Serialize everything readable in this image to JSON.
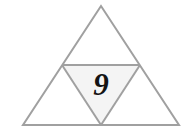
{
  "figure": {
    "name": "subdivided-equilateral-triangle",
    "background_color": "#ffffff",
    "stroke_color": "#a0a0a0",
    "stroke_width": 2,
    "inner_fill_color": "#f4f4f4",
    "label_color": "#141414",
    "width": 195,
    "height": 137
  },
  "outer_triangle": {
    "name": "outer-triangle",
    "apex": {
      "x": 101,
      "y": 6
    },
    "bottom_left": {
      "x": 23,
      "y": 125
    },
    "bottom_right": {
      "x": 179,
      "y": 125
    },
    "fill": "none",
    "label": ""
  },
  "midsegment": {
    "name": "horizontal-midsegment",
    "left": {
      "x": 62,
      "y": 65
    },
    "right": {
      "x": 140,
      "y": 65
    }
  },
  "inner_triangle": {
    "name": "inner-inverted-triangle",
    "top_left": {
      "x": 62,
      "y": 65
    },
    "top_right": {
      "x": 140,
      "y": 65
    },
    "bottom": {
      "x": 101,
      "y": 125
    },
    "fill": "#f4f4f4",
    "label": "9",
    "label_position": {
      "x": 101,
      "y": 95
    },
    "label_font_size": 31
  },
  "regions": [
    {
      "name": "top-triangle",
      "label": ""
    },
    {
      "name": "left-triangle",
      "label": ""
    },
    {
      "name": "right-triangle",
      "label": ""
    },
    {
      "name": "center-triangle",
      "label": "9"
    }
  ],
  "chart_data": {
    "type": "diagram",
    "title": "",
    "shapes": [
      {
        "id": "outer-triangle",
        "kind": "triangle",
        "points": [
          [
            101,
            6
          ],
          [
            23,
            125
          ],
          [
            179,
            125
          ]
        ],
        "fill": "none",
        "stroke": "#a0a0a0",
        "label": ""
      },
      {
        "id": "center-triangle",
        "kind": "triangle",
        "points": [
          [
            62,
            65
          ],
          [
            140,
            65
          ],
          [
            101,
            125
          ]
        ],
        "fill": "#f4f4f4",
        "stroke": "#a0a0a0",
        "label": "9"
      }
    ],
    "lines": [
      {
        "id": "midsegment",
        "from": [
          62,
          65
        ],
        "to": [
          140,
          65
        ],
        "stroke": "#a0a0a0"
      },
      {
        "id": "left-inner-edge",
        "from": [
          62,
          65
        ],
        "to": [
          101,
          125
        ],
        "stroke": "#a0a0a0"
      },
      {
        "id": "right-inner-edge",
        "from": [
          140,
          65
        ],
        "to": [
          101,
          125
        ],
        "stroke": "#a0a0a0"
      }
    ],
    "labels": [
      {
        "text": "9",
        "x": 101,
        "y": 95
      }
    ]
  }
}
